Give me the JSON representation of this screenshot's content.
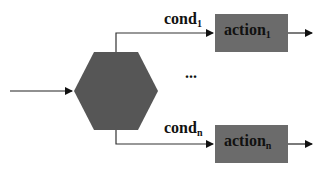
{
  "diagram": {
    "type": "flow",
    "colors": {
      "shape_fill": "#555555",
      "box_fill": "#6a6a6a",
      "line": "#222222"
    },
    "decision": {
      "shape": "hexagon"
    },
    "branches": [
      {
        "cond": "cond",
        "cond_sub": "1",
        "action": "action",
        "action_sub": "1"
      },
      {
        "cond": "cond",
        "cond_sub": "n",
        "action": "action",
        "action_sub": "n"
      }
    ],
    "ellipsis": "..."
  }
}
